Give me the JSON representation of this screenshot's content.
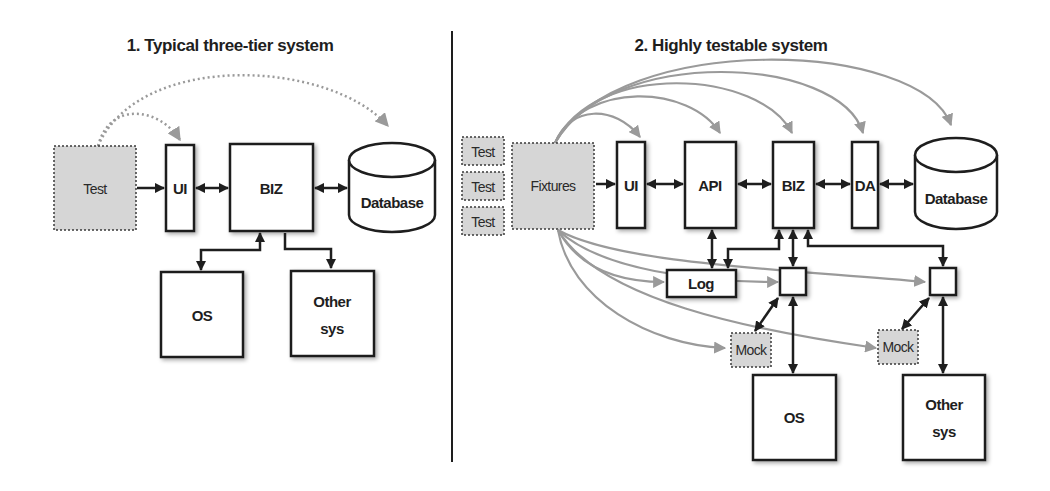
{
  "colors": {
    "ink": "#1e1e1e",
    "mock_fill": "#d6d6d6",
    "grey_arrow": "#9a9a9a",
    "background": "#ffffff"
  },
  "left_panel": {
    "title": "1. Typical three-tier system",
    "nodes": {
      "test": "Test",
      "ui": "UI",
      "biz": "BIZ",
      "database": "Database",
      "os": "OS",
      "other_line1": "Other",
      "other_line2": "sys"
    }
  },
  "right_panel": {
    "title": "2. Highly testable system",
    "tests": [
      "Test",
      "Test",
      "Test"
    ],
    "nodes": {
      "fixtures": "Fixtures",
      "ui": "UI",
      "api": "API",
      "biz": "BIZ",
      "da": "DA",
      "database": "Database",
      "log": "Log",
      "mock1": "Mock",
      "mock2": "Mock",
      "os": "OS",
      "other_line1": "Other",
      "other_line2": "sys"
    }
  }
}
